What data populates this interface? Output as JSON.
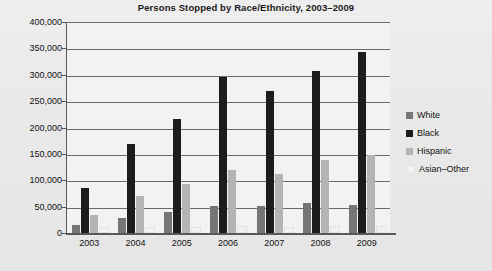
{
  "chart_data": {
    "type": "bar",
    "title": "Persons Stopped by Race/Ethnicity, 2003–2009",
    "xlabel": "",
    "ylabel": "",
    "categories": [
      "2003",
      "2004",
      "2005",
      "2006",
      "2007",
      "2008",
      "2009"
    ],
    "series": [
      {
        "name": "White",
        "color": "#767676",
        "values": [
          16000,
          28000,
          40000,
          51000,
          52000,
          57000,
          53000
        ]
      },
      {
        "name": "Black",
        "color": "#1c1c1c",
        "values": [
          85000,
          169000,
          216000,
          296000,
          270000,
          308000,
          343000
        ]
      },
      {
        "name": "Hispanic",
        "color": "#b4b4b4",
        "values": [
          35000,
          70000,
          93000,
          119000,
          111000,
          138000,
          147000
        ]
      },
      {
        "name": "Asian–Other",
        "color": "#f2f2f2",
        "values": [
          7000,
          7000,
          8000,
          9000,
          8000,
          9000,
          9000
        ]
      }
    ],
    "ylim": [
      0,
      400000
    ],
    "ytick_labels": [
      "400,000",
      "350,000",
      "300,000",
      "250,000",
      "200,000",
      "150,000",
      "100,000",
      "50,000",
      "0"
    ],
    "ytick_values": [
      400000,
      350000,
      300000,
      250000,
      200000,
      150000,
      100000,
      50000,
      0
    ],
    "grid": true,
    "legend_position": "right"
  },
  "legend": {
    "items": [
      {
        "label": "White"
      },
      {
        "label": "Black"
      },
      {
        "label": "Hispanic"
      },
      {
        "label": "Asian–Other"
      }
    ]
  }
}
